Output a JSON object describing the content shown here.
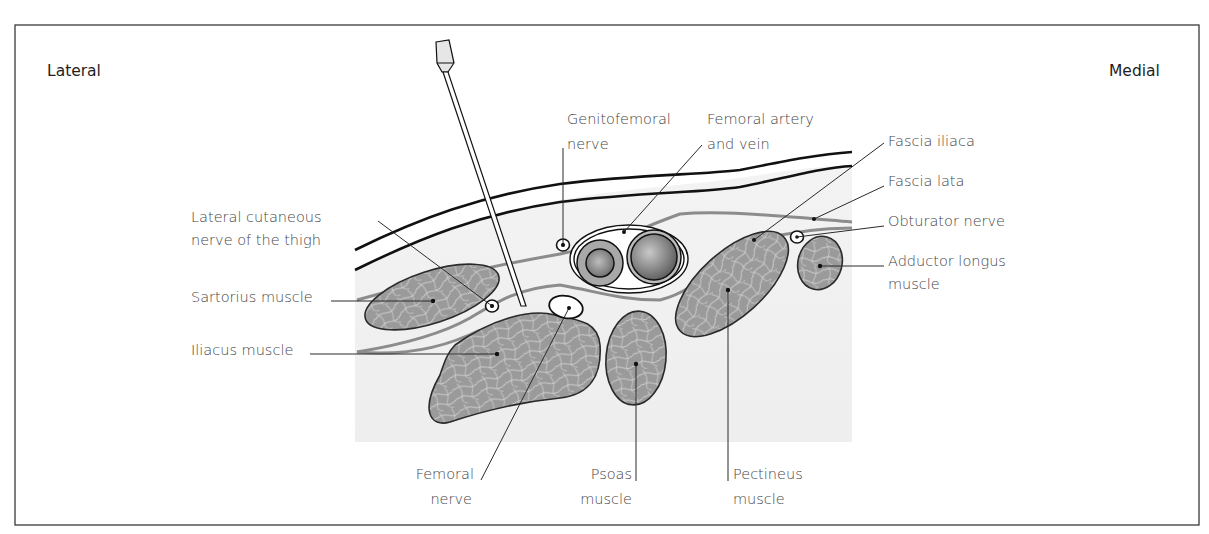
{
  "diagram": {
    "title_left": "Lateral",
    "title_right": "Medial",
    "colors": {
      "frame": "#3a3a3a",
      "tissue_bg": "#f1f1f1",
      "muscle_fill": "#9a9a9a",
      "muscle_fibre": "#d8d8d8",
      "fascia": "#8c8c8c",
      "skin": "#111111"
    },
    "labels": {
      "lateral_cutaneous_line1": "Lateral cutaneous",
      "lateral_cutaneous_line2": "nerve of the thigh",
      "sartorius": "Sartorius muscle",
      "iliacus": "Iliacus muscle",
      "genitofemoral_line1": "Genitofemoral",
      "genitofemoral_line2": "nerve",
      "femoral_vessels_line1": "Femoral artery",
      "femoral_vessels_line2": "and vein",
      "fascia_iliaca": "Fascia iliaca",
      "fascia_lata": "Fascia lata",
      "obturator_nerve": "Obturator nerve",
      "adductor_longus_line1": "Adductor longus",
      "adductor_longus_line2": "muscle",
      "femoral_nerve_line1": "Femoral",
      "femoral_nerve_line2": "nerve",
      "psoas_line1": "Psoas",
      "psoas_line2": "muscle",
      "pectineus_line1": "Pectineus",
      "pectineus_line2": "muscle"
    },
    "structures": [
      "Skin",
      "Subcutaneous tissue",
      "Fascia lata",
      "Fascia iliaca",
      "Sartorius muscle",
      "Iliacus muscle",
      "Psoas muscle",
      "Pectineus muscle",
      "Adductor longus muscle",
      "Femoral artery",
      "Femoral vein",
      "Femoral nerve",
      "Genitofemoral nerve",
      "Lateral cutaneous nerve of the thigh",
      "Obturator nerve",
      "Block needle"
    ]
  }
}
